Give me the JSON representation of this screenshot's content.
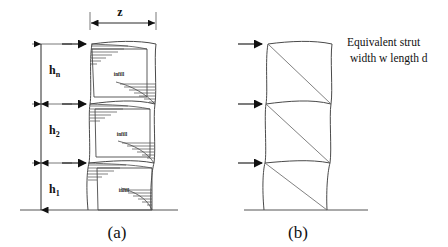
{
  "figure": {
    "background_color": "#ffffff",
    "line_color": "#4a4a4a",
    "dim_color": "#111111",
    "panels": [
      {
        "id": "a",
        "caption": "(a)",
        "description": "Multi-storey infilled frame with deformed columns and diagonal contact zones",
        "storey_labels": [
          {
            "base": "h",
            "subscript": "n",
            "label": "h n"
          },
          {
            "base": "h",
            "subscript": "2",
            "label": "h 2"
          },
          {
            "base": "h",
            "subscript": "1",
            "label": "h 1"
          }
        ],
        "bay_dimension_label": "z",
        "infill_label": "infill",
        "infill_count": 3,
        "load_arrow_count": 3
      },
      {
        "id": "b",
        "caption": "(b)",
        "description": "Equivalent diagonal strut idealisation of the infilled frame",
        "annotation_line_1": "Equivalent strut",
        "annotation_line_2": "width  w  length  d",
        "strut_count": 3,
        "load_arrow_count": 3
      }
    ]
  }
}
